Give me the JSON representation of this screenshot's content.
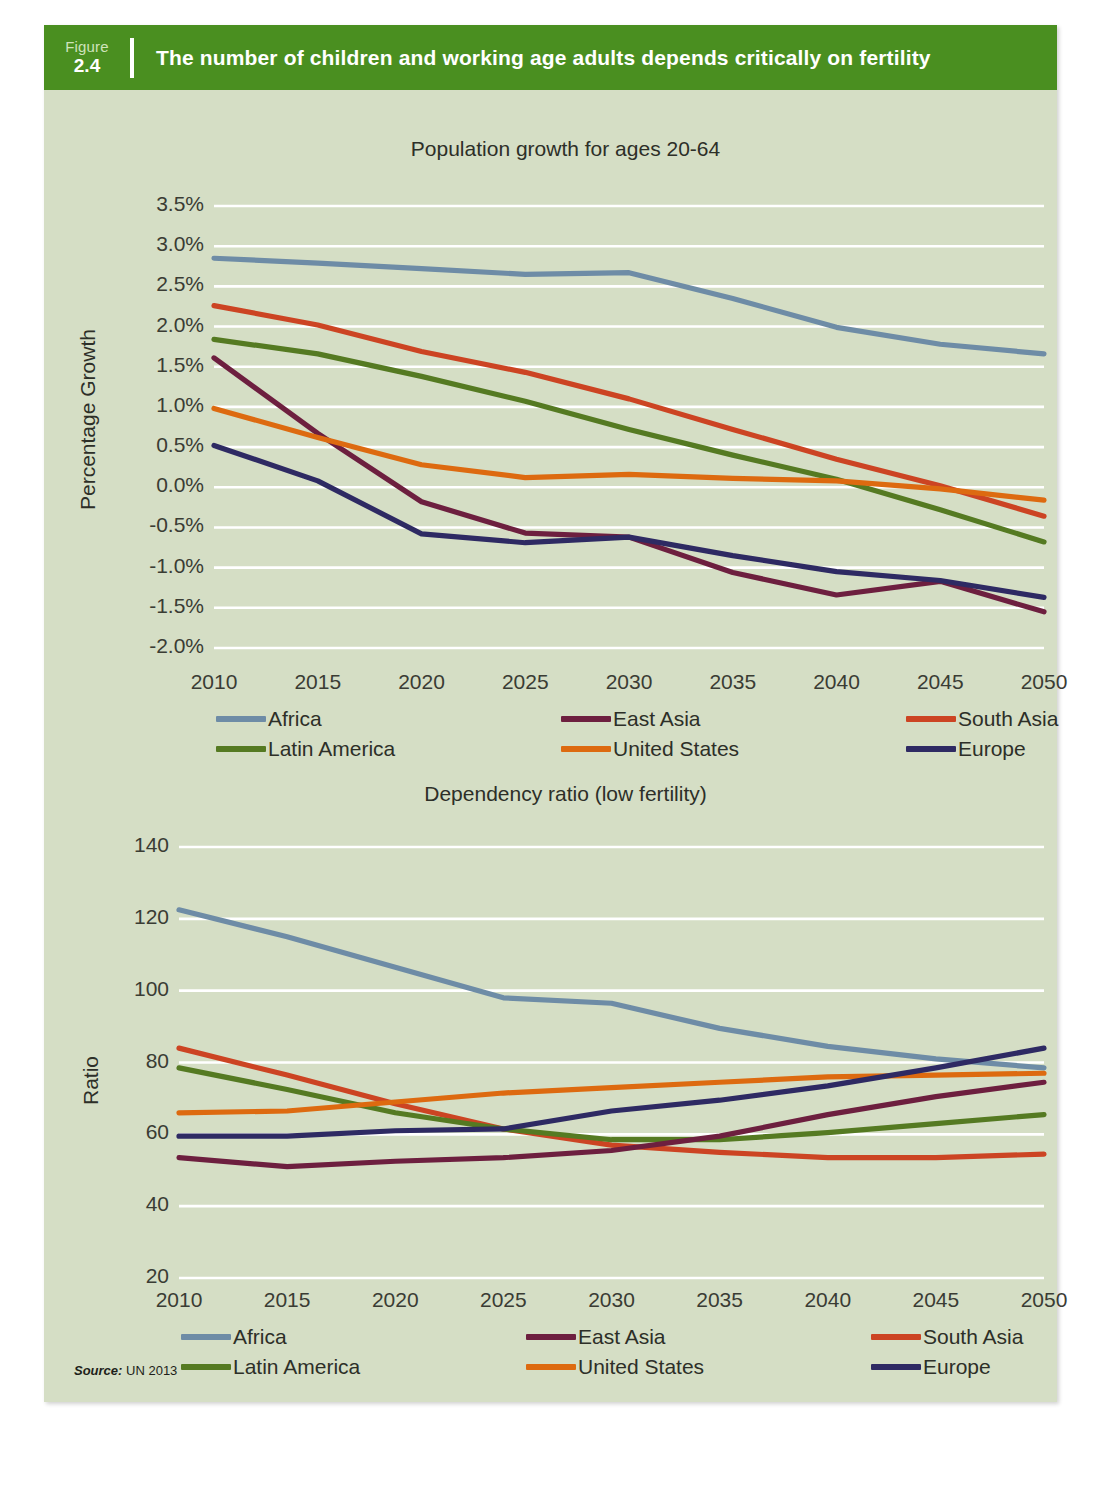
{
  "figure": {
    "badge_word": "Figure",
    "badge_number": "2.4",
    "title": "The number of children and working age adults depends critically on fertility",
    "source_label": "Source:",
    "source_text": "UN 2013",
    "header_color": "#4a8f20",
    "panel_bg": "#d5dec5",
    "gridline_color": "#ffffff"
  },
  "legend": {
    "items": [
      {
        "label": "Africa",
        "color": "#6e8ca6"
      },
      {
        "label": "East Asia",
        "color": "#6d1f3f"
      },
      {
        "label": "South Asia",
        "color": "#cc4423"
      },
      {
        "label": "Latin America",
        "color": "#557a22"
      },
      {
        "label": "United States",
        "color": "#dd6a10"
      },
      {
        "label": "Europe",
        "color": "#2e2a63"
      }
    ]
  },
  "chart_data": [
    {
      "type": "line",
      "title": "Population growth for ages 20-64",
      "xlabel": "",
      "ylabel": "Percentage  Growth",
      "x": [
        2010,
        2015,
        2020,
        2025,
        2030,
        2035,
        2040,
        2045,
        2050
      ],
      "xticks": [
        "2010",
        "2015",
        "2020",
        "2025",
        "2030",
        "2035",
        "2040",
        "2045",
        "2050"
      ],
      "yticks": [
        "3.5%",
        "3.0%",
        "2.5%",
        "2.0%",
        "1.5%",
        "1.0%",
        "0.5%",
        "0.0%",
        "-0.5%",
        "-1.0%",
        "-1.5%",
        "-2.0%"
      ],
      "ytick_values": [
        3.5,
        3.0,
        2.5,
        2.0,
        1.5,
        1.0,
        0.5,
        0.0,
        -0.5,
        -1.0,
        -1.5,
        -2.0
      ],
      "ylim": [
        -2.0,
        3.5
      ],
      "xlim": [
        2010,
        2050
      ],
      "grid": true,
      "legend_position": "below",
      "units": "percent",
      "series": [
        {
          "name": "Africa",
          "color": "#6e8ca6",
          "values": [
            2.85,
            2.79,
            2.72,
            2.65,
            2.67,
            2.35,
            1.99,
            1.78,
            1.66
          ]
        },
        {
          "name": "South Asia",
          "color": "#cc4423",
          "values": [
            2.26,
            2.02,
            1.69,
            1.43,
            1.1,
            0.72,
            0.35,
            0.02,
            -0.36
          ]
        },
        {
          "name": "Latin America",
          "color": "#557a22",
          "values": [
            1.84,
            1.66,
            1.38,
            1.07,
            0.72,
            0.4,
            0.1,
            -0.28,
            -0.68
          ]
        },
        {
          "name": "East Asia",
          "color": "#6d1f3f",
          "values": [
            1.61,
            0.67,
            -0.18,
            -0.57,
            -0.62,
            -1.06,
            -1.34,
            -1.17,
            -1.55
          ]
        },
        {
          "name": "United States",
          "color": "#dd6a10",
          "values": [
            0.98,
            0.62,
            0.28,
            0.12,
            0.16,
            0.11,
            0.08,
            -0.02,
            -0.16
          ]
        },
        {
          "name": "Europe",
          "color": "#2e2a63",
          "values": [
            0.52,
            0.08,
            -0.58,
            -0.69,
            -0.62,
            -0.85,
            -1.05,
            -1.16,
            -1.37
          ]
        }
      ]
    },
    {
      "type": "line",
      "title": "Dependency ratio (low fertility)",
      "xlabel": "",
      "ylabel": "Ratio",
      "x": [
        2010,
        2015,
        2020,
        2025,
        2030,
        2035,
        2040,
        2045,
        2050
      ],
      "xticks": [
        "2010",
        "2015",
        "2020",
        "2025",
        "2030",
        "2035",
        "2040",
        "2045",
        "2050"
      ],
      "yticks": [
        "140",
        "120",
        "100",
        "80",
        "60",
        "40",
        "20"
      ],
      "ytick_values": [
        140,
        120,
        100,
        80,
        60,
        40,
        20
      ],
      "ylim": [
        20,
        140
      ],
      "xlim": [
        2010,
        2050
      ],
      "grid": true,
      "legend_position": "below",
      "units": "ratio",
      "series": [
        {
          "name": "Africa",
          "color": "#6e8ca6",
          "values": [
            122.5,
            115.0,
            106.5,
            98.0,
            96.5,
            89.5,
            84.5,
            81.0,
            78.5
          ]
        },
        {
          "name": "South Asia",
          "color": "#cc4423",
          "values": [
            84.0,
            76.5,
            68.5,
            61.5,
            57.0,
            55.0,
            53.5,
            53.5,
            54.5
          ]
        },
        {
          "name": "Latin America",
          "color": "#557a22",
          "values": [
            78.5,
            72.5,
            66.0,
            61.5,
            58.5,
            58.5,
            60.5,
            63.0,
            65.5
          ]
        },
        {
          "name": "United States",
          "color": "#dd6a10",
          "values": [
            66.0,
            66.5,
            69.0,
            71.5,
            73.0,
            74.5,
            76.0,
            76.5,
            77.0
          ]
        },
        {
          "name": "Europe",
          "color": "#2e2a63",
          "values": [
            59.5,
            59.5,
            61.0,
            61.5,
            66.5,
            69.5,
            73.5,
            78.5,
            84.0
          ]
        },
        {
          "name": "East Asia",
          "color": "#6d1f3f",
          "values": [
            53.5,
            51.0,
            52.5,
            53.5,
            55.5,
            59.5,
            65.5,
            70.5,
            74.5
          ]
        }
      ]
    }
  ]
}
